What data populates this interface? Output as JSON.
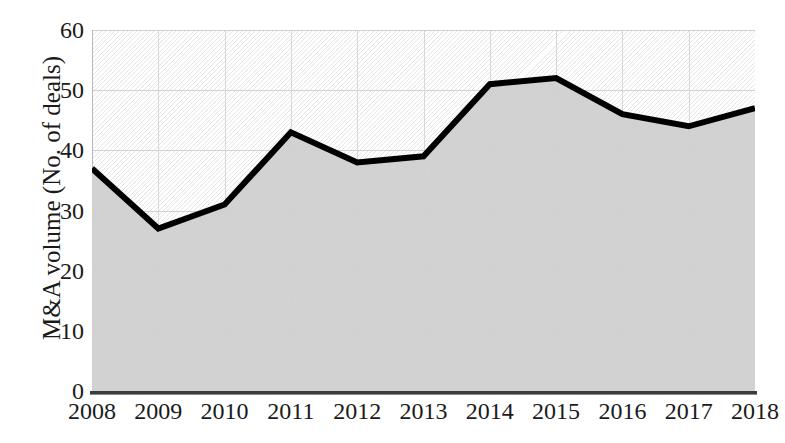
{
  "chart_data": {
    "type": "area",
    "title": "",
    "xlabel": "",
    "ylabel": "M&A volume (No. of deals)",
    "categories": [
      "2008",
      "2009",
      "2010",
      "2011",
      "2012",
      "2013",
      "2014",
      "2015",
      "2016",
      "2017",
      "2018"
    ],
    "values": [
      37,
      27,
      31,
      43,
      38,
      39,
      51,
      52,
      46,
      44,
      47
    ],
    "series": [
      {
        "name": "M&A volume (No. of deals)",
        "values": [
          37,
          27,
          31,
          43,
          38,
          39,
          51,
          52,
          46,
          44,
          47
        ]
      }
    ],
    "ylim": [
      0,
      60
    ],
    "ytick_labels": [
      "0",
      "10",
      "20",
      "30",
      "40",
      "50",
      "60"
    ],
    "ytick_values": [
      0,
      10,
      20,
      30,
      40,
      50,
      60
    ],
    "xtick_labels": [
      "2008",
      "2009",
      "2010",
      "2011",
      "2012",
      "2013",
      "2014",
      "2015",
      "2016",
      "2017",
      "2018"
    ],
    "grid": true,
    "legend": "none",
    "colors": {
      "line": "#000000",
      "fill": "#d0d0d0",
      "gridline": "#d2d2d2",
      "axis": "#3c3c3c",
      "background": "#ffffff"
    }
  }
}
